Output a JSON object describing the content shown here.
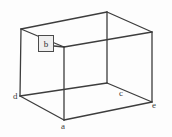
{
  "figure": {
    "title": "",
    "background_color": "#fdfdfd",
    "stroke_color": "#3d3d3d",
    "label_color": "#3a3a3a",
    "shape": "rectangular-box-wireframe",
    "vertex_labels": [
      {
        "id": "a",
        "text": "a",
        "x": 64,
        "y": 120
      },
      {
        "id": "c",
        "text": "c",
        "x": 122,
        "y": 95
      },
      {
        "id": "d",
        "text": "d",
        "x": 20,
        "y": 96
      },
      {
        "id": "e",
        "text": "e",
        "x": 152,
        "y": 102
      }
    ],
    "callout": {
      "text": "b",
      "box_fill": "#efefef",
      "box_border": "#4b4b4b",
      "x": 38,
      "y": 35,
      "width": 16,
      "height": 17
    },
    "vertices": {
      "front_bottom": {
        "x": 64,
        "y": 120
      },
      "left_bottom": {
        "x": 20,
        "y": 96
      },
      "right_bottom": {
        "x": 152,
        "y": 102
      },
      "back_bottom": {
        "x": 107,
        "y": 83
      },
      "front_top": {
        "x": 64,
        "y": 47
      },
      "left_top": {
        "x": 21,
        "y": 29
      },
      "right_top": {
        "x": 152,
        "y": 32
      },
      "back_top": {
        "x": 107,
        "y": 12
      }
    }
  }
}
